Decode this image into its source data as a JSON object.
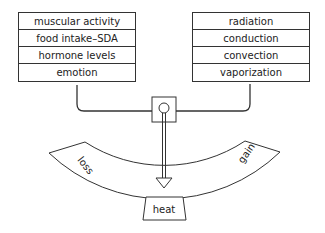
{
  "diagram": {
    "gain_factors": [
      "muscular activity",
      "food intake–SDA",
      "hormone levels",
      "emotion"
    ],
    "loss_factors": [
      "radiation",
      "conduction",
      "convection",
      "vaporization"
    ],
    "scale": {
      "left_label": "loss",
      "right_label": "gain",
      "center_label": "heat"
    },
    "colors": {
      "line": "#333333",
      "background": "#ffffff"
    }
  }
}
